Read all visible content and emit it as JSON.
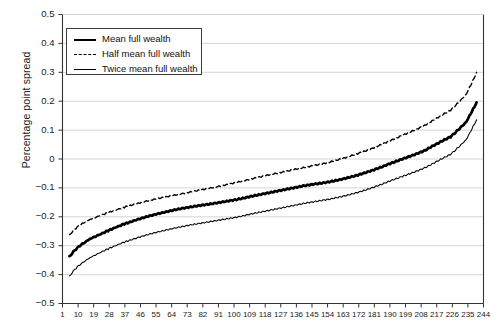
{
  "chart_data": {
    "type": "line",
    "title": "",
    "xlabel": "",
    "ylabel": "Percentage point spread",
    "xlim": [
      1,
      244
    ],
    "ylim": [
      -0.5,
      0.5
    ],
    "grid": true,
    "legend_position": "top-left",
    "ytick_labels": [
      "0.5",
      "0.4",
      "0.3",
      "0.2",
      "0.1",
      "0",
      "−0.1",
      "−0.2",
      "−0.3",
      "−0.4",
      "−0.5"
    ],
    "ytick_values": [
      0.5,
      0.4,
      0.3,
      0.2,
      0.1,
      0,
      -0.1,
      -0.2,
      -0.3,
      -0.4,
      -0.5
    ],
    "xtick_labels": [
      "1",
      "10",
      "19",
      "28",
      "37",
      "46",
      "55",
      "64",
      "73",
      "82",
      "91",
      "100",
      "109",
      "118",
      "127",
      "136",
      "145",
      "154",
      "163",
      "172",
      "181",
      "190",
      "199",
      "208",
      "217",
      "226",
      "235",
      "244"
    ],
    "xtick_values": [
      1,
      10,
      19,
      28,
      37,
      46,
      55,
      64,
      73,
      82,
      91,
      100,
      109,
      118,
      127,
      136,
      145,
      154,
      163,
      172,
      181,
      190,
      199,
      208,
      217,
      226,
      235,
      244
    ],
    "x": [
      5,
      8,
      11,
      14,
      17,
      20,
      24,
      28,
      32,
      36,
      40,
      45,
      50,
      55,
      60,
      65,
      70,
      75,
      80,
      85,
      90,
      95,
      100,
      105,
      110,
      115,
      120,
      125,
      130,
      135,
      140,
      145,
      150,
      155,
      160,
      165,
      170,
      175,
      180,
      185,
      190,
      195,
      200,
      205,
      210,
      215,
      220,
      225,
      228,
      231,
      234,
      236,
      238,
      240
    ],
    "series": [
      {
        "name": "Mean full wealth",
        "style": "solid-bold",
        "color": "#000000",
        "values": [
          -0.338,
          -0.316,
          -0.3,
          -0.288,
          -0.276,
          -0.268,
          -0.257,
          -0.246,
          -0.236,
          -0.226,
          -0.218,
          -0.208,
          -0.199,
          -0.191,
          -0.184,
          -0.177,
          -0.171,
          -0.166,
          -0.161,
          -0.157,
          -0.152,
          -0.147,
          -0.142,
          -0.136,
          -0.129,
          -0.123,
          -0.117,
          -0.111,
          -0.105,
          -0.099,
          -0.093,
          -0.088,
          -0.084,
          -0.079,
          -0.073,
          -0.066,
          -0.058,
          -0.049,
          -0.039,
          -0.028,
          -0.016,
          -0.005,
          0.006,
          0.017,
          0.029,
          0.046,
          0.062,
          0.077,
          0.093,
          0.11,
          0.128,
          0.15,
          0.172,
          0.196
        ]
      },
      {
        "name": "Half mean full wealth",
        "style": "dashed",
        "color": "#000000",
        "values": [
          -0.263,
          -0.243,
          -0.229,
          -0.218,
          -0.209,
          -0.202,
          -0.193,
          -0.184,
          -0.176,
          -0.168,
          -0.161,
          -0.153,
          -0.145,
          -0.138,
          -0.132,
          -0.126,
          -0.12,
          -0.114,
          -0.108,
          -0.102,
          -0.096,
          -0.09,
          -0.083,
          -0.076,
          -0.069,
          -0.062,
          -0.055,
          -0.049,
          -0.043,
          -0.036,
          -0.03,
          -0.024,
          -0.018,
          -0.011,
          -0.003,
          0.006,
          0.016,
          0.026,
          0.037,
          0.05,
          0.063,
          0.076,
          0.089,
          0.102,
          0.116,
          0.134,
          0.152,
          0.169,
          0.186,
          0.204,
          0.224,
          0.248,
          0.272,
          0.3
        ]
      },
      {
        "name": "Twice mean full wealth",
        "style": "solid-thin",
        "color": "#000000",
        "values": [
          -0.406,
          -0.382,
          -0.366,
          -0.353,
          -0.341,
          -0.332,
          -0.32,
          -0.309,
          -0.299,
          -0.289,
          -0.281,
          -0.271,
          -0.262,
          -0.254,
          -0.247,
          -0.24,
          -0.234,
          -0.228,
          -0.223,
          -0.218,
          -0.213,
          -0.208,
          -0.203,
          -0.197,
          -0.19,
          -0.184,
          -0.178,
          -0.172,
          -0.166,
          -0.16,
          -0.154,
          -0.149,
          -0.144,
          -0.139,
          -0.133,
          -0.126,
          -0.118,
          -0.109,
          -0.099,
          -0.088,
          -0.076,
          -0.065,
          -0.054,
          -0.043,
          -0.031,
          -0.015,
          0.001,
          0.016,
          0.032,
          0.049,
          0.067,
          0.089,
          0.112,
          0.136
        ]
      }
    ]
  },
  "legend": {
    "items": [
      {
        "label": "Mean full wealth"
      },
      {
        "label": "Half mean full wealth"
      },
      {
        "label": "Twice mean full wealth"
      }
    ]
  }
}
